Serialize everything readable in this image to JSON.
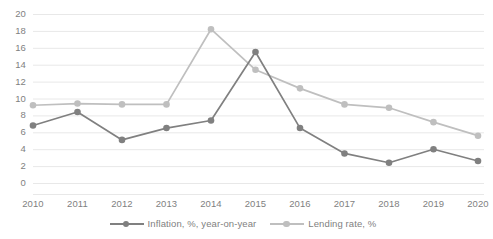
{
  "chart_data": {
    "type": "line",
    "title": "",
    "xlabel": "",
    "ylabel": "",
    "categories": [
      "2010",
      "2011",
      "2012",
      "2013",
      "2014",
      "2015",
      "2016",
      "2017",
      "2018",
      "2019",
      "2020"
    ],
    "ylim": [
      0,
      20
    ],
    "y_ticks": [
      "0",
      "2",
      "4",
      "6",
      "8",
      "10",
      "12",
      "14",
      "16",
      "18",
      "20"
    ],
    "grid": true,
    "legend_position": "bottom",
    "series": [
      {
        "name": "Inflation, %, year-on-year",
        "color": "#808080",
        "marker": "circle",
        "values": [
          6.8,
          8.4,
          5.1,
          6.5,
          7.4,
          15.5,
          6.5,
          3.5,
          2.4,
          4.0,
          2.6
        ]
      },
      {
        "name": "Lending rate, %",
        "color": "#bfbfbf",
        "marker": "circle",
        "values": [
          9.2,
          9.4,
          9.3,
          9.3,
          18.2,
          13.4,
          11.2,
          9.3,
          8.9,
          7.2,
          5.6
        ]
      }
    ]
  },
  "axes": {
    "grid_color": "#e8e8e8",
    "tick_text_color": "#7f7f7f"
  }
}
